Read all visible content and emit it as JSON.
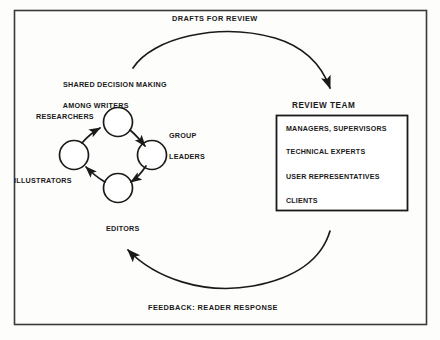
{
  "figure": {
    "title_top": "DRAFTS FOR REVIEW",
    "caption_bottom": "FEEDBACK: READER RESPONSE",
    "frame_color": "#3a3a3a",
    "ink_color": "#1a1a1a",
    "background_color": "#fdfdfc"
  },
  "writers_cluster": {
    "heading_line1": "SHARED DECISION MAKING",
    "heading_line2": "AMONG WRITERS",
    "nodes": [
      {
        "label": "RESEARCHERS",
        "position": "top"
      },
      {
        "label": "GROUP\nLEADERS",
        "label_line1": "GROUP",
        "label_line2": "LEADERS",
        "position": "right"
      },
      {
        "label": "EDITORS",
        "position": "bottom"
      },
      {
        "label": "ILLUSTRATORS",
        "position": "left"
      }
    ]
  },
  "review_team": {
    "heading": "REVIEW TEAM",
    "members": [
      "MANAGERS, SUPERVISORS",
      "TECHNICAL EXPERTS",
      "USER REPRESENTATIVES",
      "CLIENTS"
    ]
  },
  "flows": [
    {
      "name": "drafts-for-review",
      "from": "writers",
      "to": "review-team",
      "label": "DRAFTS FOR REVIEW"
    },
    {
      "name": "feedback-reader-response",
      "from": "review-team",
      "to": "writers",
      "label": "FEEDBACK: READER RESPONSE"
    }
  ]
}
